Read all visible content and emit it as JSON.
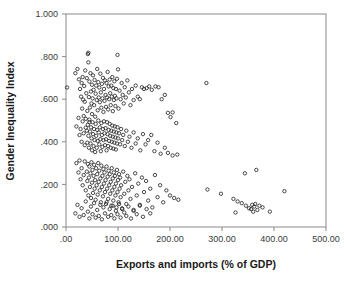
{
  "figure": {
    "name": "scatterplot-gender-inequality-vs-trade",
    "background_color": "#ffffff",
    "frame_color": "#8a8a8a",
    "marker_color": "#2b2b2b",
    "marker_style": "open-circle"
  },
  "chart_data": {
    "type": "scatter",
    "title": "",
    "xlabel": "Exports and imports (% of GDP)",
    "ylabel": "Gender Inequality Index",
    "xlim": [
      0,
      500
    ],
    "ylim": [
      0.0,
      1.0
    ],
    "xticks": [
      0,
      100,
      200,
      300,
      400,
      500
    ],
    "xtick_labels": [
      ".00",
      "100.00",
      "200.00",
      "300.00",
      "400.00",
      "500.00"
    ],
    "yticks": [
      0.0,
      0.2,
      0.4,
      0.6,
      0.8,
      1.0
    ],
    "ytick_labels": [
      ".000",
      ".200",
      ".400",
      ".600",
      ".800",
      "1.000"
    ],
    "grid": false,
    "legend": false,
    "legend_position": "none",
    "marker": "open-circle",
    "marker_size": 3.4,
    "points": [
      [
        2,
        0.655
      ],
      [
        18,
        0.722
      ],
      [
        22,
        0.742
      ],
      [
        25,
        0.693
      ],
      [
        27,
        0.648
      ],
      [
        29,
        0.612
      ],
      [
        30,
        0.676
      ],
      [
        31,
        0.556
      ],
      [
        32,
        0.704
      ],
      [
        33,
        0.598
      ],
      [
        34,
        0.521
      ],
      [
        35,
        0.662
      ],
      [
        36,
        0.588
      ],
      [
        37,
        0.735
      ],
      [
        38,
        0.466
      ],
      [
        39,
        0.628
      ],
      [
        40,
        0.699
      ],
      [
        41,
        0.545
      ],
      [
        42,
        0.812
      ],
      [
        43,
        0.818
      ],
      [
        43,
        0.773
      ],
      [
        44,
        0.61
      ],
      [
        45,
        0.683
      ],
      [
        45,
        0.492
      ],
      [
        46,
        0.561
      ],
      [
        47,
        0.722
      ],
      [
        48,
        0.636
      ],
      [
        49,
        0.58
      ],
      [
        50,
        0.668
      ],
      [
        50,
        0.53
      ],
      [
        51,
        0.604
      ],
      [
        52,
        0.712
      ],
      [
        53,
        0.644
      ],
      [
        54,
        0.572
      ],
      [
        55,
        0.69
      ],
      [
        56,
        0.518
      ],
      [
        57,
        0.626
      ],
      [
        58,
        0.664
      ],
      [
        59,
        0.596
      ],
      [
        60,
        0.742
      ],
      [
        61,
        0.548
      ],
      [
        62,
        0.68
      ],
      [
        63,
        0.608
      ],
      [
        64,
        0.655
      ],
      [
        65,
        0.586
      ],
      [
        66,
        0.72
      ],
      [
        67,
        0.632
      ],
      [
        68,
        0.56
      ],
      [
        69,
        0.672
      ],
      [
        70,
        0.604
      ],
      [
        71,
        0.7
      ],
      [
        72,
        0.54
      ],
      [
        73,
        0.648
      ],
      [
        74,
        0.592
      ],
      [
        75,
        0.688
      ],
      [
        76,
        0.62
      ],
      [
        77,
        0.564
      ],
      [
        78,
        0.676
      ],
      [
        79,
        0.608
      ],
      [
        80,
        0.728
      ],
      [
        81,
        0.552
      ],
      [
        82,
        0.66
      ],
      [
        83,
        0.6
      ],
      [
        84,
        0.692
      ],
      [
        85,
        0.628
      ],
      [
        86,
        0.572
      ],
      [
        87,
        0.664
      ],
      [
        88,
        0.612
      ],
      [
        89,
        0.704
      ],
      [
        90,
        0.544
      ],
      [
        91,
        0.652
      ],
      [
        92,
        0.596
      ],
      [
        93,
        0.684
      ],
      [
        94,
        0.616
      ],
      [
        95,
        0.568
      ],
      [
        96,
        0.648
      ],
      [
        97,
        0.604
      ],
      [
        98,
        0.696
      ],
      [
        99,
        0.808
      ],
      [
        100,
        0.74
      ],
      [
        101,
        0.556
      ],
      [
        103,
        0.64
      ],
      [
        105,
        0.6
      ],
      [
        107,
        0.676
      ],
      [
        109,
        0.62
      ],
      [
        111,
        0.58
      ],
      [
        113,
        0.656
      ],
      [
        115,
        0.608
      ],
      [
        118,
        0.688
      ],
      [
        121,
        0.632
      ],
      [
        124,
        0.572
      ],
      [
        127,
        0.648
      ],
      [
        130,
        0.596
      ],
      [
        134,
        0.664
      ],
      [
        138,
        0.612
      ],
      [
        142,
        0.6
      ],
      [
        146,
        0.656
      ],
      [
        150,
        0.648
      ],
      [
        155,
        0.652
      ],
      [
        160,
        0.66
      ],
      [
        165,
        0.644
      ],
      [
        172,
        0.66
      ],
      [
        178,
        0.656
      ],
      [
        184,
        0.6
      ],
      [
        190,
        0.62
      ],
      [
        196,
        0.536
      ],
      [
        201,
        0.516
      ],
      [
        205,
        0.538
      ],
      [
        212,
        0.488
      ],
      [
        270,
        0.676
      ],
      [
        20,
        0.472
      ],
      [
        24,
        0.512
      ],
      [
        26,
        0.432
      ],
      [
        28,
        0.46
      ],
      [
        30,
        0.4
      ],
      [
        32,
        0.496
      ],
      [
        34,
        0.44
      ],
      [
        36,
        0.384
      ],
      [
        38,
        0.508
      ],
      [
        40,
        0.452
      ],
      [
        41,
        0.396
      ],
      [
        42,
        0.48
      ],
      [
        43,
        0.428
      ],
      [
        44,
        0.372
      ],
      [
        45,
        0.504
      ],
      [
        46,
        0.448
      ],
      [
        47,
        0.392
      ],
      [
        48,
        0.468
      ],
      [
        49,
        0.416
      ],
      [
        50,
        0.36
      ],
      [
        51,
        0.492
      ],
      [
        52,
        0.436
      ],
      [
        53,
        0.38
      ],
      [
        54,
        0.46
      ],
      [
        55,
        0.408
      ],
      [
        56,
        0.352
      ],
      [
        57,
        0.484
      ],
      [
        58,
        0.428
      ],
      [
        59,
        0.372
      ],
      [
        60,
        0.456
      ],
      [
        61,
        0.404
      ],
      [
        62,
        0.5
      ],
      [
        63,
        0.444
      ],
      [
        64,
        0.388
      ],
      [
        65,
        0.468
      ],
      [
        66,
        0.412
      ],
      [
        67,
        0.356
      ],
      [
        68,
        0.488
      ],
      [
        69,
        0.432
      ],
      [
        70,
        0.376
      ],
      [
        71,
        0.46
      ],
      [
        72,
        0.408
      ],
      [
        73,
        0.496
      ],
      [
        74,
        0.44
      ],
      [
        75,
        0.384
      ],
      [
        76,
        0.464
      ],
      [
        77,
        0.412
      ],
      [
        78,
        0.36
      ],
      [
        79,
        0.492
      ],
      [
        80,
        0.436
      ],
      [
        81,
        0.38
      ],
      [
        82,
        0.456
      ],
      [
        83,
        0.404
      ],
      [
        84,
        0.484
      ],
      [
        85,
        0.428
      ],
      [
        86,
        0.372
      ],
      [
        87,
        0.452
      ],
      [
        88,
        0.4
      ],
      [
        89,
        0.476
      ],
      [
        90,
        0.424
      ],
      [
        91,
        0.368
      ],
      [
        92,
        0.448
      ],
      [
        93,
        0.396
      ],
      [
        94,
        0.472
      ],
      [
        95,
        0.42
      ],
      [
        96,
        0.364
      ],
      [
        97,
        0.444
      ],
      [
        98,
        0.392
      ],
      [
        99,
        0.468
      ],
      [
        100,
        0.416
      ],
      [
        102,
        0.44
      ],
      [
        104,
        0.388
      ],
      [
        106,
        0.46
      ],
      [
        108,
        0.408
      ],
      [
        110,
        0.432
      ],
      [
        113,
        0.38
      ],
      [
        116,
        0.452
      ],
      [
        119,
        0.4
      ],
      [
        122,
        0.424
      ],
      [
        126,
        0.372
      ],
      [
        130,
        0.444
      ],
      [
        134,
        0.392
      ],
      [
        138,
        0.416
      ],
      [
        143,
        0.36
      ],
      [
        148,
        0.436
      ],
      [
        153,
        0.388
      ],
      [
        158,
        0.408
      ],
      [
        164,
        0.432
      ],
      [
        170,
        0.356
      ],
      [
        176,
        0.396
      ],
      [
        182,
        0.344
      ],
      [
        190,
        0.372
      ],
      [
        196,
        0.348
      ],
      [
        205,
        0.336
      ],
      [
        214,
        0.34
      ],
      [
        20,
        0.3
      ],
      [
        24,
        0.256
      ],
      [
        26,
        0.312
      ],
      [
        28,
        0.224
      ],
      [
        30,
        0.276
      ],
      [
        32,
        0.196
      ],
      [
        34,
        0.244
      ],
      [
        36,
        0.308
      ],
      [
        38,
        0.172
      ],
      [
        40,
        0.26
      ],
      [
        41,
        0.216
      ],
      [
        42,
        0.296
      ],
      [
        43,
        0.148
      ],
      [
        44,
        0.232
      ],
      [
        45,
        0.284
      ],
      [
        46,
        0.188
      ],
      [
        47,
        0.252
      ],
      [
        48,
        0.136
      ],
      [
        49,
        0.304
      ],
      [
        50,
        0.208
      ],
      [
        51,
        0.268
      ],
      [
        52,
        0.16
      ],
      [
        53,
        0.24
      ],
      [
        54,
        0.292
      ],
      [
        55,
        0.18
      ],
      [
        56,
        0.22
      ],
      [
        57,
        0.128
      ],
      [
        58,
        0.276
      ],
      [
        59,
        0.196
      ],
      [
        60,
        0.248
      ],
      [
        61,
        0.152
      ],
      [
        62,
        0.3
      ],
      [
        63,
        0.212
      ],
      [
        64,
        0.264
      ],
      [
        65,
        0.172
      ],
      [
        66,
        0.228
      ],
      [
        67,
        0.116
      ],
      [
        68,
        0.288
      ],
      [
        69,
        0.188
      ],
      [
        70,
        0.24
      ],
      [
        71,
        0.144
      ],
      [
        72,
        0.272
      ],
      [
        73,
        0.204
      ],
      [
        74,
        0.256
      ],
      [
        75,
        0.164
      ],
      [
        76,
        0.22
      ],
      [
        77,
        0.108
      ],
      [
        78,
        0.284
      ],
      [
        79,
        0.18
      ],
      [
        80,
        0.236
      ],
      [
        81,
        0.132
      ],
      [
        82,
        0.264
      ],
      [
        83,
        0.196
      ],
      [
        84,
        0.248
      ],
      [
        85,
        0.156
      ],
      [
        86,
        0.212
      ],
      [
        87,
        0.1
      ],
      [
        88,
        0.276
      ],
      [
        89,
        0.172
      ],
      [
        90,
        0.228
      ],
      [
        91,
        0.124
      ],
      [
        92,
        0.256
      ],
      [
        93,
        0.188
      ],
      [
        94,
        0.24
      ],
      [
        95,
        0.148
      ],
      [
        96,
        0.204
      ],
      [
        97,
        0.092
      ],
      [
        98,
        0.268
      ],
      [
        99,
        0.164
      ],
      [
        100,
        0.22
      ],
      [
        101,
        0.116
      ],
      [
        102,
        0.248
      ],
      [
        103,
        0.18
      ],
      [
        104,
        0.232
      ],
      [
        105,
        0.14
      ],
      [
        106,
        0.196
      ],
      [
        108,
        0.084
      ],
      [
        110,
        0.26
      ],
      [
        112,
        0.156
      ],
      [
        114,
        0.212
      ],
      [
        116,
        0.108
      ],
      [
        118,
        0.24
      ],
      [
        120,
        0.172
      ],
      [
        122,
        0.224
      ],
      [
        124,
        0.132
      ],
      [
        127,
        0.188
      ],
      [
        130,
        0.076
      ],
      [
        133,
        0.252
      ],
      [
        136,
        0.148
      ],
      [
        139,
        0.204
      ],
      [
        142,
        0.1
      ],
      [
        146,
        0.232
      ],
      [
        150,
        0.164
      ],
      [
        154,
        0.216
      ],
      [
        158,
        0.124
      ],
      [
        162,
        0.18
      ],
      [
        166,
        0.092
      ],
      [
        171,
        0.244
      ],
      [
        176,
        0.14
      ],
      [
        181,
        0.196
      ],
      [
        187,
        0.116
      ],
      [
        193,
        0.172
      ],
      [
        200,
        0.148
      ],
      [
        208,
        0.136
      ],
      [
        216,
        0.128
      ],
      [
        18,
        0.064
      ],
      [
        22,
        0.104
      ],
      [
        26,
        0.048
      ],
      [
        30,
        0.088
      ],
      [
        34,
        0.056
      ],
      [
        38,
        0.12
      ],
      [
        42,
        0.072
      ],
      [
        45,
        0.04
      ],
      [
        48,
        0.096
      ],
      [
        51,
        0.06
      ],
      [
        54,
        0.112
      ],
      [
        57,
        0.044
      ],
      [
        60,
        0.08
      ],
      [
        63,
        0.052
      ],
      [
        66,
        0.104
      ],
      [
        69,
        0.036
      ],
      [
        72,
        0.092
      ],
      [
        75,
        0.064
      ],
      [
        78,
        0.116
      ],
      [
        81,
        0.048
      ],
      [
        84,
        0.084
      ],
      [
        87,
        0.056
      ],
      [
        90,
        0.1
      ],
      [
        93,
        0.04
      ],
      [
        96,
        0.076
      ],
      [
        99,
        0.06
      ],
      [
        102,
        0.108
      ],
      [
        105,
        0.044
      ],
      [
        108,
        0.088
      ],
      [
        112,
        0.068
      ],
      [
        116,
        0.052
      ],
      [
        120,
        0.096
      ],
      [
        125,
        0.04
      ],
      [
        130,
        0.08
      ],
      [
        136,
        0.06
      ],
      [
        142,
        0.104
      ],
      [
        148,
        0.048
      ],
      [
        155,
        0.084
      ],
      [
        162,
        0.064
      ],
      [
        272,
        0.176
      ],
      [
        298,
        0.156
      ],
      [
        322,
        0.132
      ],
      [
        326,
        0.068
      ],
      [
        330,
        0.12
      ],
      [
        338,
        0.112
      ],
      [
        344,
        0.252
      ],
      [
        346,
        0.1
      ],
      [
        352,
        0.088
      ],
      [
        356,
        0.084
      ],
      [
        358,
        0.104
      ],
      [
        360,
        0.072
      ],
      [
        362,
        0.096
      ],
      [
        364,
        0.108
      ],
      [
        366,
        0.268
      ],
      [
        368,
        0.08
      ],
      [
        372,
        0.1
      ],
      [
        378,
        0.092
      ],
      [
        392,
        0.072
      ],
      [
        420,
        0.168
      ]
    ]
  }
}
